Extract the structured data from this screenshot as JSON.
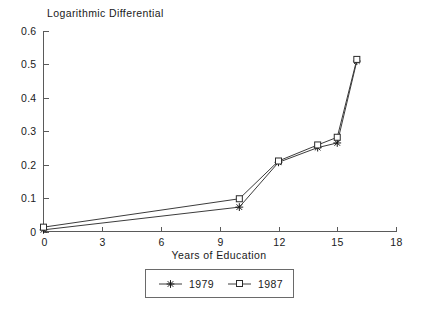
{
  "chart_data": {
    "type": "line",
    "title": "Logarithmic Differential",
    "subtitle": "",
    "xlabel": "Years of Education",
    "ylabel": "",
    "xlim": [
      0,
      18
    ],
    "ylim": [
      0,
      0.6
    ],
    "xticks": [
      "0",
      "3",
      "6",
      "9",
      "12",
      "15",
      "18"
    ],
    "xtick_values": [
      0,
      3,
      6,
      9,
      12,
      15,
      18
    ],
    "yticks": [
      "0",
      "0.1",
      "0.2",
      "0.3",
      "0.4",
      "0.5",
      "0.6"
    ],
    "ytick_values": [
      0,
      0.1,
      0.2,
      0.3,
      0.4,
      0.5,
      0.6
    ],
    "grid": false,
    "legend_position": "below-center",
    "x": [
      0,
      10,
      12,
      14,
      15,
      16
    ],
    "series": [
      {
        "name": "1979",
        "marker": "star",
        "color": "#1a1a1a",
        "values": [
          0.005,
          0.073,
          0.207,
          0.251,
          0.265,
          0.51
        ]
      },
      {
        "name": "1987",
        "marker": "square",
        "color": "#2b2b2b",
        "values": [
          0.013,
          0.098,
          0.211,
          0.259,
          0.282,
          0.515
        ]
      }
    ]
  },
  "legend": {
    "entries": [
      {
        "label": "1979",
        "marker": "star-marker"
      },
      {
        "label": "1987",
        "marker": "square-marker"
      }
    ]
  },
  "colors": {
    "background": "#ffffff",
    "axis": "#5a5a5a",
    "line": "#3c3c3c",
    "text": "#1a1a1a",
    "legend_border": "#6a6a6a"
  }
}
